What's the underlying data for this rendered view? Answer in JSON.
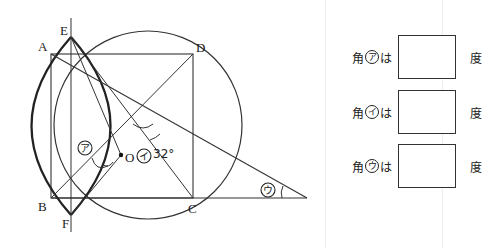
{
  "figure": {
    "points": {
      "A": "A",
      "B": "B",
      "C": "C",
      "D": "D",
      "E": "E",
      "F": "F",
      "O": "O"
    },
    "angle_given": "32°",
    "angle_marks": {
      "a": "ア",
      "i": "イ",
      "u": "ウ"
    }
  },
  "answers": [
    {
      "prefix": "角",
      "mark": "ア",
      "suffix": "は",
      "value": "",
      "unit": "度"
    },
    {
      "prefix": "角",
      "mark": "イ",
      "suffix": "は",
      "value": "",
      "unit": "度"
    },
    {
      "prefix": "角",
      "mark": "ウ",
      "suffix": "は",
      "value": "",
      "unit": "度"
    }
  ]
}
